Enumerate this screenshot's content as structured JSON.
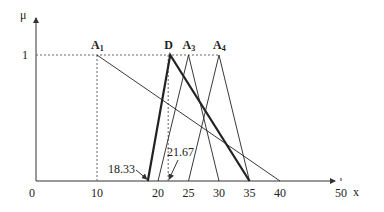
{
  "chart_data": {
    "type": "line",
    "title": "",
    "xlabel": "x",
    "ylabel": "μ",
    "xlim": [
      0,
      55
    ],
    "ylim": [
      0,
      1.1
    ],
    "x_ticks": [
      "0",
      "10",
      "20",
      "25",
      "30",
      "35",
      "40",
      "50"
    ],
    "y_ticks": [
      "1"
    ],
    "grid": false,
    "legend": "none (inline peak labels)",
    "series": [
      {
        "name": "A1",
        "label": "A",
        "sub": "1",
        "style": "thin",
        "points": [
          [
            10,
            1
          ],
          [
            40,
            0
          ]
        ],
        "peak_dropline": true
      },
      {
        "name": "D",
        "label": "D",
        "sub": "",
        "style": "thick",
        "points": [
          [
            18.33,
            0
          ],
          [
            22,
            1
          ],
          [
            35,
            0
          ]
        ]
      },
      {
        "name": "A3",
        "label": "A",
        "sub": "3",
        "style": "thin",
        "points": [
          [
            20,
            0
          ],
          [
            25,
            1
          ],
          [
            30,
            0
          ]
        ]
      },
      {
        "name": "A4",
        "label": "A",
        "sub": "4",
        "style": "thin",
        "points": [
          [
            25,
            0
          ],
          [
            30,
            1
          ],
          [
            35,
            0
          ]
        ]
      }
    ],
    "annotations": [
      {
        "text": "18.33",
        "x": 18.33,
        "arrow_to": [
          18.33,
          0
        ]
      },
      {
        "text": "21.67",
        "x": 21.67,
        "arrow_to": [
          21.67,
          0
        ],
        "dropline": true
      }
    ],
    "reference_lines": [
      {
        "type": "horizontal",
        "y": 1,
        "style": "dotted",
        "from_x": 0,
        "to_x": 30
      },
      {
        "type": "vertical",
        "x": 10,
        "style": "dotted"
      },
      {
        "type": "vertical",
        "x": 21.67,
        "style": "dotted"
      }
    ]
  }
}
